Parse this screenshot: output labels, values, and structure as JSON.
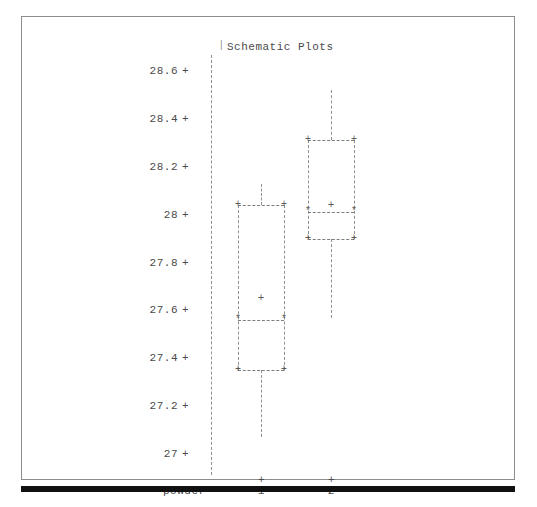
{
  "plot": {
    "title": "Schematic Plots",
    "title_tick_glyph": "|",
    "accent_color": "#8f8f8f",
    "text_color": "#4a4a4a",
    "background_color": "#ffffff",
    "frame_color": "#8c8c8c",
    "bottom_bar_color": "#111111"
  },
  "axes": {
    "x_title": "powder",
    "y_ticks": [
      "28.6",
      "28.4",
      "28.2",
      "28",
      "27.8",
      "27.6",
      "27.4",
      "27.2",
      "27"
    ],
    "tick_glyph": "+",
    "x_tick_glyph": "+",
    "x_categories": [
      "1",
      "2"
    ]
  },
  "markers": {
    "corner_glyph": "+",
    "median_end_glyph": "*",
    "mean_glyph": "+"
  },
  "chart_data": {
    "type": "box",
    "title": "Schematic Plots",
    "xlabel": "powder",
    "ylabel": "",
    "ylim": [
      27.0,
      28.6
    ],
    "yticks": [
      27.0,
      27.2,
      27.4,
      27.6,
      27.8,
      28.0,
      28.2,
      28.4,
      28.6
    ],
    "grid": false,
    "legend": "none",
    "categories": [
      "1",
      "2"
    ],
    "boxes": [
      {
        "category": "1",
        "whisker_high": 28.13,
        "q3": 28.04,
        "mean": 27.65,
        "median": 27.56,
        "q1": 27.35,
        "whisker_low": 27.07
      },
      {
        "category": "2",
        "whisker_high": 28.52,
        "q3": 28.31,
        "mean": 28.04,
        "median": 28.01,
        "q1": 27.9,
        "whisker_low": 27.57
      }
    ]
  }
}
